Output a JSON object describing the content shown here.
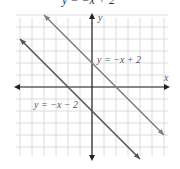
{
  "chart_data": {
    "type": "line",
    "title": "y = −x + 2",
    "xlabel": "x",
    "ylabel": "y",
    "xlim": [
      -7,
      6
    ],
    "ylim": [
      -6,
      6
    ],
    "grid": true,
    "legend": "none",
    "series": [
      {
        "name": "y = −x + 2",
        "equation": "y = -x + 2",
        "slope": -1,
        "intercept": 2,
        "x": [
          -4,
          6
        ],
        "y": [
          6,
          -4
        ],
        "color": "#808080"
      },
      {
        "name": "y = −x − 2",
        "equation": "y = -x - 2",
        "slope": -1,
        "intercept": -2,
        "x": [
          -6,
          4
        ],
        "y": [
          4,
          -6
        ],
        "color": "#555555"
      }
    ],
    "annotations": [
      {
        "text": "y = −x + 2",
        "at": [
          0.3,
          1.6
        ]
      },
      {
        "text": "y = −x − 2",
        "at": [
          -5.3,
          -2.2
        ]
      }
    ]
  },
  "labels": {
    "top_title": "y = −x + 2",
    "x_axis": "x",
    "y_axis": "y",
    "line1": "y = −x + 2",
    "line2": "y = −x − 2"
  }
}
